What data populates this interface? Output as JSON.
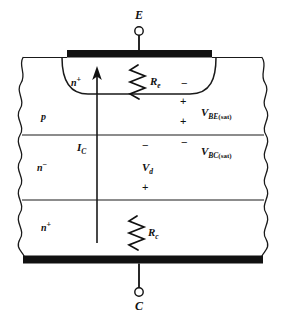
{
  "figure": {
    "type": "semiconductor-cross-section"
  },
  "terminals": {
    "emitter": {
      "label": "E",
      "x": 139,
      "y": 16
    },
    "collector": {
      "label": "C",
      "x": 139,
      "y": 307
    }
  },
  "regions": [
    {
      "name": "emitter-n-plus",
      "base": "n",
      "sup": "+",
      "x": 74,
      "y": 82
    },
    {
      "name": "base-p",
      "base": "p",
      "sup": "",
      "x": 43,
      "y": 116
    },
    {
      "name": "collector-n-minus",
      "base": "n",
      "sup": "−",
      "x": 40,
      "y": 167
    },
    {
      "name": "substrate-n-plus",
      "base": "n",
      "sup": "+",
      "x": 43,
      "y": 227
    }
  ],
  "components": {
    "emitter_resistor": {
      "label": "R",
      "sub": "e",
      "x": 152,
      "y": 82
    },
    "collector_resistor": {
      "label": "R",
      "sub": "c",
      "x": 150,
      "y": 233
    }
  },
  "currents": {
    "collector_current": {
      "label": "I",
      "sub": "C",
      "x": 83,
      "y": 148
    }
  },
  "voltages": [
    {
      "name": "v-be-sat",
      "label": "V",
      "sub": "BE",
      "paren": "(sat)",
      "x": 204,
      "y": 113
    },
    {
      "name": "v-bc-sat",
      "label": "V",
      "sub": "BC",
      "paren": "(sat)",
      "x": 204,
      "y": 152
    },
    {
      "name": "v-d",
      "label": "V",
      "sub": "d",
      "paren": "",
      "x": 145,
      "y": 168
    }
  ],
  "polarity_marks": [
    {
      "name": "vbe-minus-top",
      "symbol": "−",
      "x": 183,
      "y": 82
    },
    {
      "name": "vbe-plus",
      "symbol": "+",
      "x": 182,
      "y": 100
    },
    {
      "name": "vbc-plus-top",
      "symbol": "+",
      "x": 182,
      "y": 120
    },
    {
      "name": "vbc-minus",
      "symbol": "−",
      "x": 183,
      "y": 140
    },
    {
      "name": "vd-minus-top",
      "symbol": "−",
      "x": 144,
      "y": 142
    },
    {
      "name": "vd-plus",
      "symbol": "+",
      "x": 144,
      "y": 186
    },
    {
      "name": "ic-side-minus",
      "symbol": "−",
      "x": 143,
      "y": 146
    }
  ],
  "colors": {
    "contact_metal": "#111111",
    "line": "#1a1a1a",
    "background": "#ffffff"
  }
}
